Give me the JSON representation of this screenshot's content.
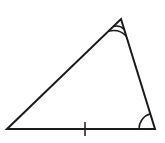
{
  "diagram": {
    "type": "triangle",
    "background": "#ffffff",
    "stroke": "#1a1a1a",
    "vertices": {
      "left": [
        7,
        129
      ],
      "top": [
        121,
        19
      ],
      "right": [
        155,
        129
      ]
    },
    "markings": {
      "top_angle": "double-arc",
      "right_angle": "single-arc",
      "bottom_side": "single-tick"
    }
  }
}
